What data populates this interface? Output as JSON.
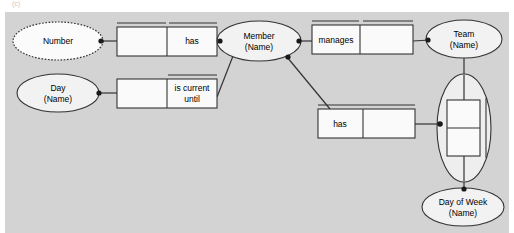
{
  "diagram": {
    "type": "er-diagram",
    "background_color": "#d3d3d3",
    "corner_mark": "(c)",
    "entities": [
      {
        "id": "number",
        "label_line1": "Number",
        "label_line2": "",
        "style": "dotted-ellipse",
        "cx": 58,
        "cy": 41,
        "rx": 45,
        "ry": 19
      },
      {
        "id": "day",
        "label_line1": "Day",
        "label_line2": "(Name)",
        "style": "ellipse",
        "cx": 58,
        "cy": 93,
        "rx": 41,
        "ry": 19
      },
      {
        "id": "member",
        "label_line1": "Member",
        "label_line2": "(Name)",
        "style": "ellipse",
        "cx": 259,
        "cy": 41,
        "rx": 42,
        "ry": 20
      },
      {
        "id": "team",
        "label_line1": "Team",
        "label_line2": "(Name)",
        "style": "ellipse",
        "cx": 464,
        "cy": 39,
        "rx": 38,
        "ry": 19
      },
      {
        "id": "day-of-week",
        "label_line1": "Day of Week",
        "label_line2": "(Name)",
        "style": "ellipse",
        "cx": 463,
        "cy": 207,
        "rx": 41,
        "ry": 19
      }
    ],
    "relationships": [
      {
        "id": "has-number",
        "label": "has",
        "label_cell": "right",
        "x": 117,
        "y": 27,
        "w": 100,
        "h": 29,
        "split_x": 0.5,
        "top_rule": "both-cells"
      },
      {
        "id": "is-current-until",
        "label": "is current until",
        "label_cell": "right",
        "x": 117,
        "y": 79,
        "w": 100,
        "h": 29,
        "split_x": 0.5,
        "top_rule": "right-cell"
      },
      {
        "id": "manages",
        "label": "manages",
        "label_cell": "left",
        "x": 312,
        "y": 25,
        "w": 101,
        "h": 29,
        "split_x": 0.47,
        "top_rule": "both-cells"
      },
      {
        "id": "has-day-of-week",
        "label": "has",
        "label_cell": "left",
        "x": 318,
        "y": 109,
        "w": 97,
        "h": 29,
        "split_x": 0.47,
        "top_rule": "full-span"
      }
    ],
    "nested_relationship": {
      "id": "team-day-of-week-nested",
      "description": "relationship box enclosed in large vertical ellipse between Team and Day of Week",
      "ellipse": {
        "cx": 464,
        "cy": 128,
        "rx": 27,
        "ry": 54
      },
      "box": {
        "x": 447,
        "y": 100,
        "w": 33,
        "h": 56,
        "split_y": 0.5
      },
      "side_bar_x": 486
    },
    "connectors": [
      {
        "from": "number",
        "to": "has-number",
        "kind": "straight-with-dot"
      },
      {
        "from": "has-number",
        "to": "member",
        "kind": "straight-with-dot"
      },
      {
        "from": "day",
        "to": "is-current-until",
        "kind": "straight-with-dot"
      },
      {
        "from": "is-current-until",
        "to": "member",
        "kind": "diagonal"
      },
      {
        "from": "member",
        "to": "manages",
        "kind": "straight-with-dot"
      },
      {
        "from": "manages",
        "to": "team",
        "kind": "straight-with-dot"
      },
      {
        "from": "member",
        "to": "has-day-of-week",
        "kind": "diagonal"
      },
      {
        "from": "has-day-of-week",
        "to": "nested-ellipse",
        "kind": "straight-with-dot"
      },
      {
        "from": "team",
        "to": "nested-ellipse",
        "kind": "vertical"
      },
      {
        "from": "nested-ellipse",
        "to": "day-of-week",
        "kind": "vertical-with-dot"
      }
    ]
  }
}
